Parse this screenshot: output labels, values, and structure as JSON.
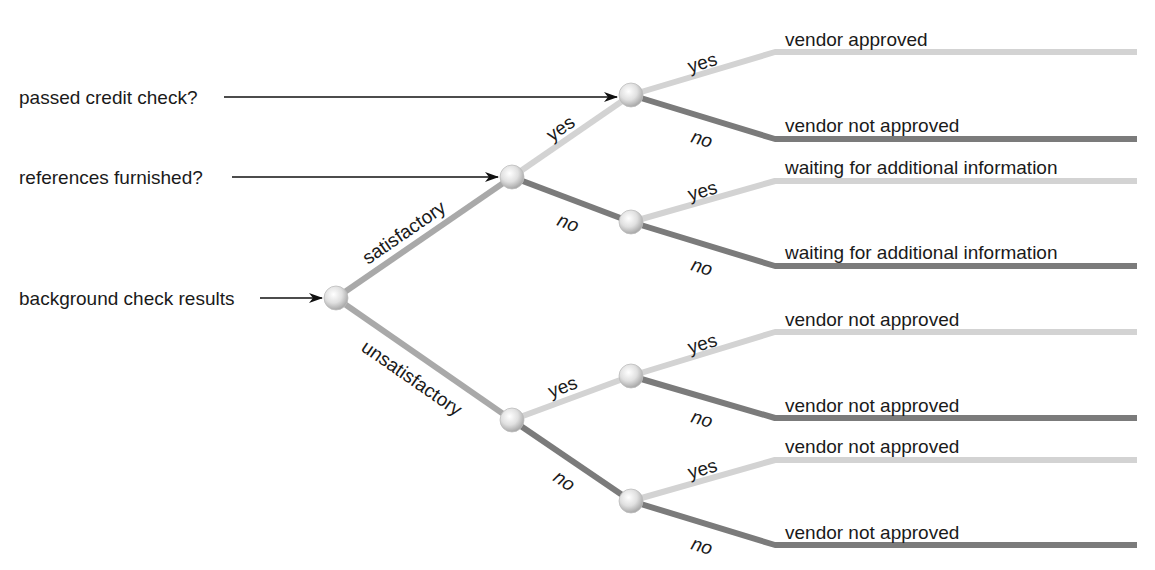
{
  "diagram": {
    "type": "decision-tree",
    "colors": {
      "light": "#d3d3d3",
      "mid": "#a9a9a9",
      "dark": "#7b7b7b",
      "text": "#1a1a1a"
    },
    "questions": [
      {
        "id": "q1",
        "label": "passed credit check?"
      },
      {
        "id": "q2",
        "label": "references furnished?"
      },
      {
        "id": "q3",
        "label": "background check results"
      }
    ],
    "branches": {
      "satisfactory": "satisfactory",
      "unsatisfactory": "unsatisfactory",
      "yes": "yes",
      "no": "no"
    },
    "outcomes": [
      {
        "label": "vendor approved",
        "path": "satisfactory > yes > yes"
      },
      {
        "label": "vendor not approved",
        "path": "satisfactory > yes > no"
      },
      {
        "label": "waiting for additional information",
        "path": "satisfactory > no > yes"
      },
      {
        "label": "waiting for additional information",
        "path": "satisfactory > no > no"
      },
      {
        "label": "vendor not approved",
        "path": "unsatisfactory > yes > yes"
      },
      {
        "label": "vendor not approved",
        "path": "unsatisfactory > yes > no"
      },
      {
        "label": "vendor not approved",
        "path": "unsatisfactory > no > yes"
      },
      {
        "label": "vendor not approved",
        "path": "unsatisfactory > no > no"
      }
    ]
  }
}
